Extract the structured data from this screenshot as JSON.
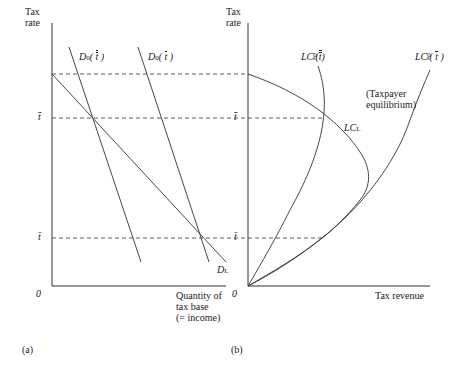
{
  "panel_a": {
    "caption": "(a)",
    "y_axis_label_line1": "Tax",
    "y_axis_label_line2": "rate",
    "x_axis_label_line1": "Quantity of",
    "x_axis_label_line2": "tax base",
    "x_axis_label_line3": "(= income)",
    "origin": "0",
    "tick_upper": "t̄̄",
    "tick_lower": "t̄",
    "curves": {
      "d0_double": {
        "name": "D",
        "sub": "0",
        "arg": "t",
        "bars": 2
      },
      "d0_single": {
        "name": "D",
        "sub": "0",
        "arg": "t",
        "bars": 1
      },
      "dl": {
        "name": "D",
        "sub": "L"
      }
    }
  },
  "panel_b": {
    "caption": "(b)",
    "y_axis_label_line1": "Tax",
    "y_axis_label_line2": "rate",
    "x_axis_label": "Tax revenue",
    "origin": "0",
    "tick_upper": "t̄̄",
    "tick_lower": "t̄",
    "annotation_line1": "(Taxpayer",
    "annotation_line2": "equilibrium)",
    "curves": {
      "lcs_double": {
        "name": "LC",
        "sub": "s",
        "sup": "0",
        "arg": "t",
        "bars": 2
      },
      "lcs_single": {
        "name": "LC",
        "sub": "s",
        "sup": "0",
        "arg": "t",
        "bars": 1
      },
      "lcl": {
        "name": "LC",
        "sub": "L"
      }
    }
  },
  "colors": {
    "line": "#333333",
    "text": "#1a1a1a",
    "background": "#ffffff"
  }
}
